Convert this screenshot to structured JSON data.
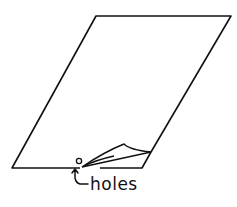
{
  "diagram": {
    "label": "holes",
    "stroke_color": "#111111",
    "background_color": "#ffffff"
  }
}
